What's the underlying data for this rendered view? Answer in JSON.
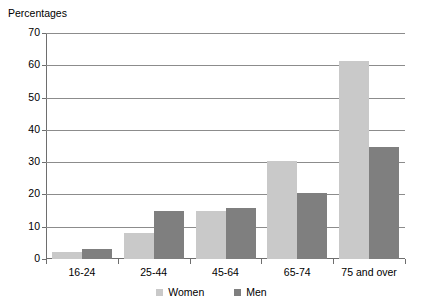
{
  "chart_data": {
    "type": "bar",
    "title": "",
    "ylabel": "Percentages",
    "xlabel": "",
    "ylim": [
      0,
      70
    ],
    "yticks": [
      0,
      10,
      20,
      30,
      40,
      50,
      60,
      70
    ],
    "grid": true,
    "legend_position": "bottom-center",
    "categories": [
      "16-24",
      "25-44",
      "45-64",
      "65-74",
      "75 and over"
    ],
    "series": [
      {
        "name": "Women",
        "color": "#c9c9c9",
        "values": [
          2.2,
          8.2,
          15.0,
          30.5,
          61.3
        ]
      },
      {
        "name": "Men",
        "color": "#7f7f7f",
        "values": [
          3.2,
          14.8,
          15.7,
          20.4,
          34.8
        ]
      }
    ]
  }
}
